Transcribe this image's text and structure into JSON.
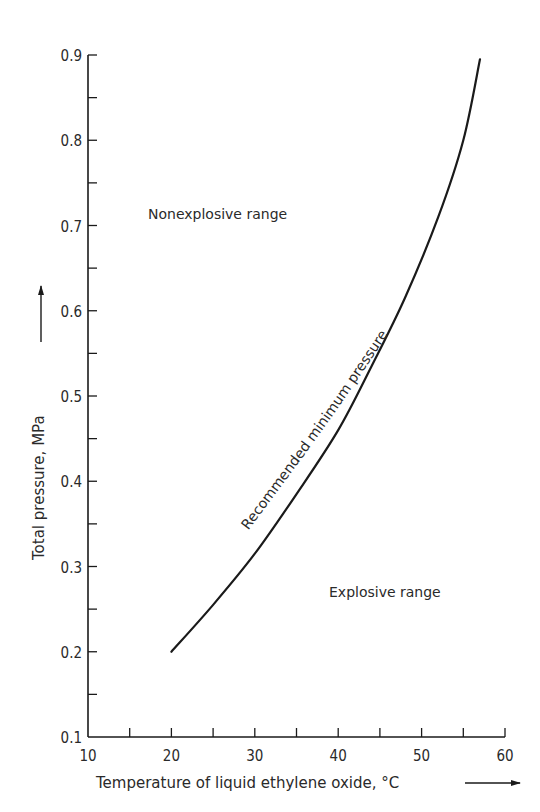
{
  "chart_data": {
    "type": "line",
    "title": "",
    "xlabel": "Temperature of liquid ethylene oxide, °C",
    "ylabel": "Total pressure, MPa",
    "xlim": [
      10,
      60
    ],
    "ylim": [
      0.1,
      0.9
    ],
    "x_ticks": [
      10,
      20,
      30,
      40,
      50,
      60
    ],
    "x_tick_labels": [
      "10",
      "20",
      "30",
      "40",
      "50",
      "60"
    ],
    "x_minor_step": 5,
    "y_ticks": [
      0.1,
      0.2,
      0.3,
      0.4,
      0.5,
      0.6,
      0.7,
      0.8,
      0.9
    ],
    "y_tick_labels": [
      "0.1",
      "0.2",
      "0.3",
      "0.4",
      "0.5",
      "0.6",
      "0.7",
      "0.8",
      "0.9"
    ],
    "y_minor_step": 0.05,
    "grid": false,
    "legend": null,
    "series": [
      {
        "name": "Recommended minimum pressure",
        "x": [
          20,
          25,
          30,
          35,
          40,
          44,
          48,
          52,
          55,
          57
        ],
        "y": [
          0.2,
          0.255,
          0.315,
          0.385,
          0.46,
          0.535,
          0.615,
          0.71,
          0.8,
          0.895
        ]
      }
    ],
    "annotations": [
      {
        "text": "Nonexplosive range",
        "x": 17,
        "y": 0.715
      },
      {
        "text": "Explosive range",
        "x": 41,
        "y": 0.27
      },
      {
        "text": "Recommended minimum pressure",
        "along_curve": true,
        "x_start": 28,
        "x_end": 46
      }
    ]
  },
  "labels": {
    "xlabel": "Temperature of liquid ethylene oxide, °C",
    "ylabel": "Total pressure, MPa",
    "nonexplosive": "Nonexplosive range",
    "explosive": "Explosive range",
    "curve_label": "Recommended minimum pressure"
  },
  "colors": {
    "ink": "#1a1a1a",
    "background": "#ffffff"
  }
}
